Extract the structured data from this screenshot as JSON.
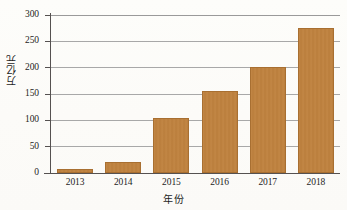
{
  "chart_data": {
    "type": "bar",
    "title": "",
    "subtitle": "",
    "xlabel": "年份",
    "ylabel": "万亿元",
    "categories": [
      "2013",
      "2014",
      "2015",
      "2016",
      "2017",
      "2018"
    ],
    "values": [
      7,
      20,
      104,
      155,
      201,
      275
    ],
    "series": [
      {
        "name": "万亿元",
        "values": [
          7,
          20,
          104,
          155,
          201,
          275
        ]
      }
    ],
    "ylim": [
      0,
      300
    ],
    "yticks": [
      0,
      50,
      100,
      150,
      200,
      250,
      300
    ],
    "ytick_labels": [
      "0",
      "50",
      "100",
      "150",
      "200",
      "250",
      "300"
    ],
    "xtick_labels": [
      "2013",
      "2014",
      "2015",
      "2016",
      "2017",
      "2018"
    ],
    "grid": true,
    "grid_axis": "y",
    "legend": false,
    "legend_position": "none",
    "annotations": [],
    "colors": {
      "bar_fill": "#C0823E",
      "bar_edge": "#A86F31",
      "gridline": "#A8A8A8",
      "axis": "#555150",
      "text": "#1D1D1D",
      "background": "#FDFDFB"
    }
  }
}
